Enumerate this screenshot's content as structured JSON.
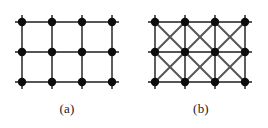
{
  "figure": {
    "background_color": "#ffffff",
    "width": 268,
    "height": 128,
    "edge_color": "#555555",
    "node_color": "#0d0d0d",
    "node_radius": 4.2,
    "edge_width": 1.9,
    "stub_length": 7,
    "panels": [
      {
        "id": "a",
        "caption": "(a)",
        "origin_x": 22,
        "origin_y": 22,
        "spacing": 30,
        "cols": 4,
        "rows": 3,
        "diagonals": false,
        "description": "square grid lattice, 4 by 3 nodes, orthogonal edges only"
      },
      {
        "id": "b",
        "caption": "(b)",
        "origin_x": 21,
        "origin_y": 22,
        "spacing": 30,
        "cols": 4,
        "rows": 3,
        "diagonals": true,
        "description": "square grid lattice, 4 by 3 nodes, orthogonal edges plus both diagonals in every cell"
      }
    ]
  }
}
